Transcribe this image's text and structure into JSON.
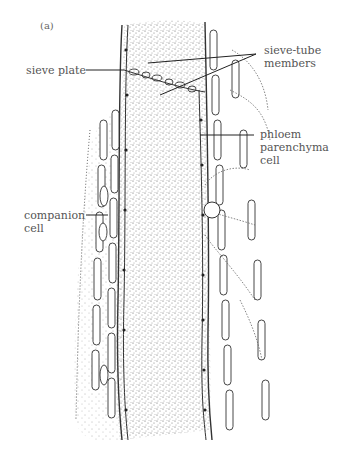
{
  "figure": {
    "panel_label": "(a)",
    "labels": {
      "sieve_plate": "sieve plate",
      "sieve_tube_members": "sieve-tube\nmembers",
      "phloem_parenchyma": "phloem\nparenchyma\ncell",
      "companion_cell": "companion\ncell"
    },
    "colors": {
      "ink": "#333333",
      "stipple": "#555555",
      "background": "#ffffff"
    }
  }
}
